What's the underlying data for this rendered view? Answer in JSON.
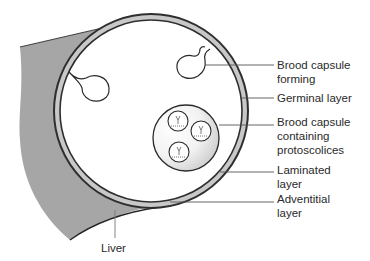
{
  "diagram": {
    "labels": {
      "brood_capsule_forming": [
        "Brood capsule",
        "forming"
      ],
      "germinal_layer": [
        "Germinal layer"
      ],
      "brood_capsule_protoscolices": [
        "Brood capsule",
        "containing",
        "protoscolices"
      ],
      "laminated_layer": [
        "Laminated",
        "layer"
      ],
      "adventitial_layer": [
        "Adventitial",
        "layer"
      ],
      "liver": [
        "Liver"
      ]
    },
    "colors": {
      "liver_fill": "#a6a6a6",
      "wall_fill": "#c8c8c8",
      "outline": "#3a3a3a",
      "leader": "#555555",
      "capsule_fill_light": "#ffffff",
      "capsule_fill_dark": "#cfcfcf"
    }
  }
}
